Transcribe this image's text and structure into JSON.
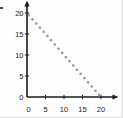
{
  "figure": {
    "background": "#fdfdfd",
    "edge_color": "#dcdcdc"
  },
  "chart_data": {
    "type": "scatter",
    "title": "",
    "xlabel": "",
    "ylabel": "",
    "xlim": [
      0,
      20
    ],
    "ylim": [
      0,
      20
    ],
    "xticks": [
      0,
      5,
      10,
      15,
      20
    ],
    "yticks": [
      0,
      5,
      10,
      15,
      20
    ],
    "grid": false,
    "legend": false,
    "axis_color": "#1b1b1b",
    "tick_label_color": "#1b1b1b",
    "series": [
      {
        "name": "dotted-descending-line",
        "marker": "dot",
        "marker_color": "#9a9a9a",
        "points": [
          [
            0.5,
            19.5
          ],
          [
            1.5,
            18.5
          ],
          [
            2.5,
            17.5
          ],
          [
            3.5,
            16.5
          ],
          [
            4.5,
            15.5
          ],
          [
            5.5,
            14.5
          ],
          [
            6.5,
            13.5
          ],
          [
            7.5,
            12.5
          ],
          [
            8.5,
            11.5
          ],
          [
            9.5,
            10.5
          ],
          [
            10.5,
            9.5
          ],
          [
            11.5,
            8.5
          ],
          [
            12.5,
            7.5
          ],
          [
            13.5,
            6.5
          ],
          [
            14.5,
            5.5
          ],
          [
            15.5,
            4.5
          ],
          [
            16.5,
            3.5
          ],
          [
            17.5,
            2.5
          ],
          [
            18.5,
            1.5
          ],
          [
            19.5,
            0.5
          ]
        ]
      }
    ]
  }
}
